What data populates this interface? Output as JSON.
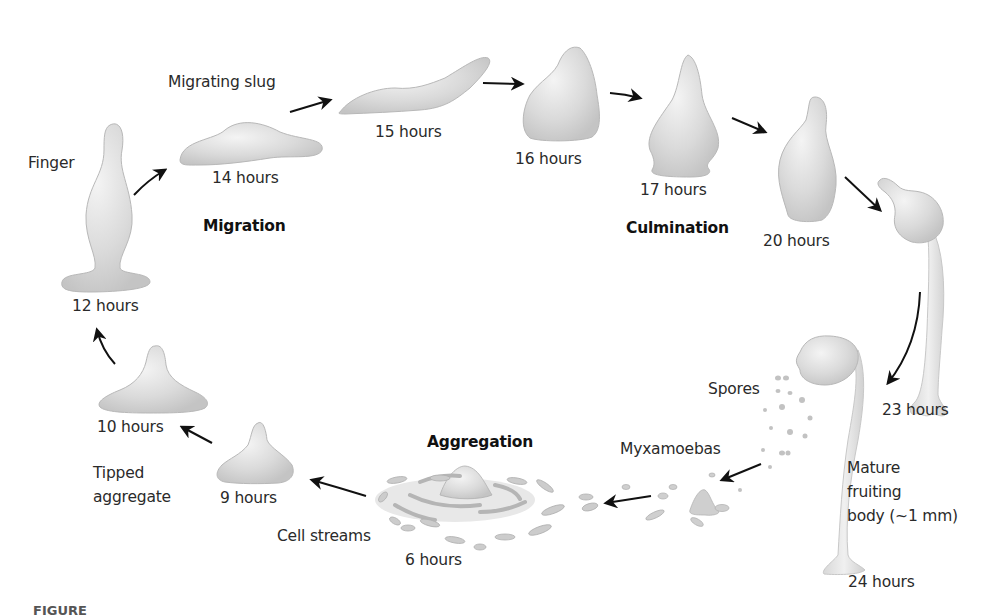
{
  "diagram": {
    "phases": {
      "migration": "Migration",
      "culmination": "Culmination",
      "aggregation": "Aggregation"
    },
    "stages": [
      {
        "time": "6 hours",
        "name": "Cell streams"
      },
      {
        "time": "9 hours",
        "name": "Tipped aggregate"
      },
      {
        "time": "10 hours",
        "name": ""
      },
      {
        "time": "12 hours",
        "name": "Finger"
      },
      {
        "time": "14 hours",
        "name": "Migrating slug"
      },
      {
        "time": "15 hours",
        "name": ""
      },
      {
        "time": "16 hours",
        "name": ""
      },
      {
        "time": "17 hours",
        "name": ""
      },
      {
        "time": "20 hours",
        "name": ""
      },
      {
        "time": "23 hours",
        "name": ""
      },
      {
        "time": "24 hours",
        "name": "Mature fruiting body (~1 mm)"
      }
    ],
    "labels": {
      "finger": "Finger",
      "migrating_slug": "Migrating slug",
      "spores": "Spores",
      "myxamoebas": "Myxamoebas",
      "mature_line1": "Mature",
      "mature_line2": "fruiting",
      "mature_line3": "body (~1 mm)",
      "tipped_line1": "Tipped",
      "tipped_line2": "aggregate",
      "cell_streams": "Cell streams"
    },
    "caption": "FIGURE"
  },
  "colors": {
    "organism_fill": "#dcdcdc",
    "organism_stroke": "#b4b4b4",
    "arrow": "#111111",
    "text": "#2a2a2a"
  }
}
